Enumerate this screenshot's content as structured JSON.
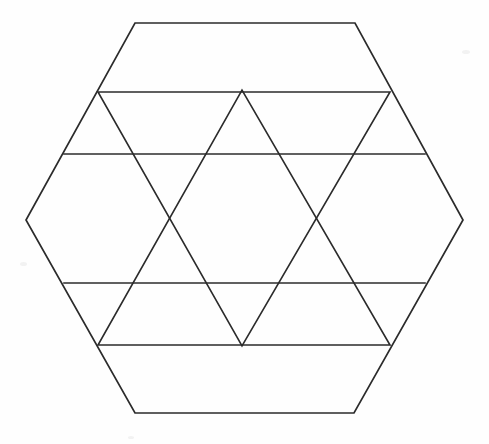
{
  "figure": {
    "background_color": "#fefefe",
    "stroke_color": "#2b2b2b",
    "stroke_width": 1.6,
    "canvas": {
      "width": 489,
      "height": 444
    }
  },
  "chart_data": {
    "type": "diagram",
    "xlabel": "",
    "ylabel": "",
    "xlim": [
      0,
      489
    ],
    "ylim": [
      0,
      444
    ],
    "grid": false,
    "legend": "none",
    "hexagon": {
      "name": "outer-hexagon",
      "orientation": "pointy-left-right",
      "center": [
        244.5,
        218
      ],
      "vertices": [
        [
          135,
          23
        ],
        [
          355,
          23
        ],
        [
          463,
          220
        ],
        [
          354,
          413
        ],
        [
          135,
          413
        ],
        [
          26,
          220
        ]
      ]
    },
    "triangle_down": {
      "name": "downward-triangle",
      "vertices": [
        [
          98,
          92
        ],
        [
          390,
          92
        ],
        [
          242,
          346
        ]
      ]
    },
    "triangle_up": {
      "name": "upward-triangle",
      "vertices": [
        [
          98,
          345
        ],
        [
          390,
          345
        ],
        [
          242,
          90
        ]
      ]
    },
    "chords": [
      {
        "name": "upper-horizontal-chord",
        "x1": 64,
        "y1": 154,
        "x2": 425,
        "y2": 154
      },
      {
        "name": "lower-horizontal-chord",
        "x1": 64,
        "y1": 283,
        "x2": 425,
        "y2": 283
      }
    ],
    "crossings": [
      {
        "name": "top-apex-crossing",
        "x": 242,
        "y": 90
      },
      {
        "name": "left-mid-crossing",
        "x": 169,
        "y": 220
      },
      {
        "name": "right-mid-crossing",
        "x": 318,
        "y": 220
      },
      {
        "name": "bottom-apex-crossing",
        "x": 242,
        "y": 346
      }
    ],
    "edge_contacts": [
      {
        "name": "top-edge-left-contact",
        "x": 208,
        "y": 23
      },
      {
        "name": "top-edge-right-contact",
        "x": 280,
        "y": 23
      },
      {
        "name": "bottom-edge-left-contact",
        "x": 207,
        "y": 413
      },
      {
        "name": "bottom-edge-right-contact",
        "x": 280,
        "y": 413
      },
      {
        "name": "upper-left-edge-contact",
        "x": 98,
        "y": 92
      },
      {
        "name": "upper-right-edge-contact",
        "x": 390,
        "y": 92
      },
      {
        "name": "lower-left-edge-contact",
        "x": 98,
        "y": 345
      },
      {
        "name": "lower-right-edge-contact",
        "x": 390,
        "y": 345
      }
    ],
    "counts": {
      "hexagon_sides": 6,
      "triangles": 2,
      "horizontal_chords": 2,
      "star_points": 6
    }
  }
}
